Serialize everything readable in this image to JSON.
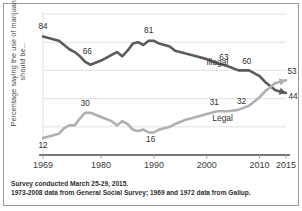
{
  "chart_data": {
    "type": "line",
    "title": "",
    "xlabel": "",
    "ylabel": "Percentage saying the use of marijuana should be...",
    "xlim": [
      1969,
      2015
    ],
    "ylim": [
      0,
      100
    ],
    "grid": true,
    "legend_position": "inline-annotations",
    "xticks": [
      1969,
      1980,
      1990,
      2000,
      2010,
      2015
    ],
    "xtick_labels": [
      "1969",
      "1980",
      "1990",
      "2000",
      "2010",
      "2015"
    ],
    "yticks": [],
    "ytick_labels": [],
    "series": [
      {
        "name": "Illegal",
        "color": "#5b5b5b",
        "label_x": 2002,
        "label_y": 64,
        "points": [
          {
            "x": 1969,
            "y": 84
          },
          {
            "x": 1972,
            "y": 81
          },
          {
            "x": 1973,
            "y": 78
          },
          {
            "x": 1974,
            "y": 75
          },
          {
            "x": 1975,
            "y": 73
          },
          {
            "x": 1976,
            "y": 70
          },
          {
            "x": 1977,
            "y": 66
          },
          {
            "x": 1978,
            "y": 64
          },
          {
            "x": 1980,
            "y": 67
          },
          {
            "x": 1982,
            "y": 71
          },
          {
            "x": 1983,
            "y": 73
          },
          {
            "x": 1984,
            "y": 70
          },
          {
            "x": 1985,
            "y": 74
          },
          {
            "x": 1986,
            "y": 79
          },
          {
            "x": 1987,
            "y": 80
          },
          {
            "x": 1988,
            "y": 78
          },
          {
            "x": 1989,
            "y": 81
          },
          {
            "x": 1990,
            "y": 81
          },
          {
            "x": 1991,
            "y": 79
          },
          {
            "x": 1993,
            "y": 77
          },
          {
            "x": 1994,
            "y": 74
          },
          {
            "x": 1996,
            "y": 72
          },
          {
            "x": 1998,
            "y": 70
          },
          {
            "x": 2000,
            "y": 68
          },
          {
            "x": 2002,
            "y": 65
          },
          {
            "x": 2004,
            "y": 63
          },
          {
            "x": 2006,
            "y": 60
          },
          {
            "x": 2008,
            "y": 60
          },
          {
            "x": 2010,
            "y": 56
          },
          {
            "x": 2011,
            "y": 52
          },
          {
            "x": 2012,
            "y": 49
          },
          {
            "x": 2013,
            "y": 46
          },
          {
            "x": 2015,
            "y": 44
          }
        ],
        "value_labels": [
          {
            "x": 1969,
            "y": 84,
            "text": "84",
            "dx": 0,
            "dy": -8
          },
          {
            "x": 1977,
            "y": 66,
            "text": "66",
            "dx": 2,
            "dy": -8
          },
          {
            "x": 1989,
            "y": 81,
            "text": "81",
            "dx": 0,
            "dy": -8
          },
          {
            "x": 2004,
            "y": 63,
            "text": "63",
            "dx": -4,
            "dy": -6
          },
          {
            "x": 2007,
            "y": 60,
            "text": "60",
            "dx": 3,
            "dy": -6
          },
          {
            "x": 2015,
            "y": 44,
            "text": "44",
            "dx": 7,
            "dy": 6
          }
        ]
      },
      {
        "name": "Legal",
        "color": "#b0b0b0",
        "label_x": 2003,
        "label_y": 24,
        "points": [
          {
            "x": 1969,
            "y": 12
          },
          {
            "x": 1972,
            "y": 15
          },
          {
            "x": 1973,
            "y": 19
          },
          {
            "x": 1974,
            "y": 21
          },
          {
            "x": 1975,
            "y": 21
          },
          {
            "x": 1976,
            "y": 26
          },
          {
            "x": 1977,
            "y": 30
          },
          {
            "x": 1978,
            "y": 30
          },
          {
            "x": 1980,
            "y": 27
          },
          {
            "x": 1982,
            "y": 24
          },
          {
            "x": 1983,
            "y": 21
          },
          {
            "x": 1984,
            "y": 24
          },
          {
            "x": 1985,
            "y": 22
          },
          {
            "x": 1986,
            "y": 18
          },
          {
            "x": 1987,
            "y": 17
          },
          {
            "x": 1988,
            "y": 18
          },
          {
            "x": 1989,
            "y": 16
          },
          {
            "x": 1990,
            "y": 16
          },
          {
            "x": 1991,
            "y": 18
          },
          {
            "x": 1993,
            "y": 20
          },
          {
            "x": 1994,
            "y": 22
          },
          {
            "x": 1996,
            "y": 25
          },
          {
            "x": 1998,
            "y": 27
          },
          {
            "x": 2000,
            "y": 29
          },
          {
            "x": 2002,
            "y": 31
          },
          {
            "x": 2004,
            "y": 31
          },
          {
            "x": 2006,
            "y": 32
          },
          {
            "x": 2008,
            "y": 35
          },
          {
            "x": 2010,
            "y": 41
          },
          {
            "x": 2011,
            "y": 45
          },
          {
            "x": 2012,
            "y": 48
          },
          {
            "x": 2013,
            "y": 51
          },
          {
            "x": 2015,
            "y": 53
          }
        ],
        "value_labels": [
          {
            "x": 1969,
            "y": 12,
            "text": "12",
            "dx": 0,
            "dy": 10
          },
          {
            "x": 1977,
            "y": 30,
            "text": "30",
            "dx": 0,
            "dy": -7
          },
          {
            "x": 1989,
            "y": 16,
            "text": "16",
            "dx": 2,
            "dy": 10
          },
          {
            "x": 2002,
            "y": 31,
            "text": "31",
            "dx": -3,
            "dy": -6
          },
          {
            "x": 2006,
            "y": 32,
            "text": "32",
            "dx": 3,
            "dy": -6
          },
          {
            "x": 2015,
            "y": 53,
            "text": "53",
            "dx": 6,
            "dy": -6
          }
        ]
      }
    ]
  },
  "footer": {
    "line1": "Survey conducted March 25-29, 2015.",
    "line2": "1973-2008 data from General Social Survey; 1969 and 1972 data from Gallup."
  }
}
